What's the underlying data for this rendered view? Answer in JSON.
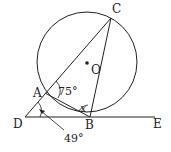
{
  "diagram": {
    "points": {
      "A": "A",
      "B": "B",
      "C": "C",
      "D": "D",
      "E": "E",
      "O": "O"
    },
    "angles": {
      "angle_DAB_ext": "75°",
      "angle_ABC": "x",
      "angle_ADB": "49°"
    },
    "colors": {
      "stroke": "#222222",
      "background": "#ffffff"
    }
  }
}
